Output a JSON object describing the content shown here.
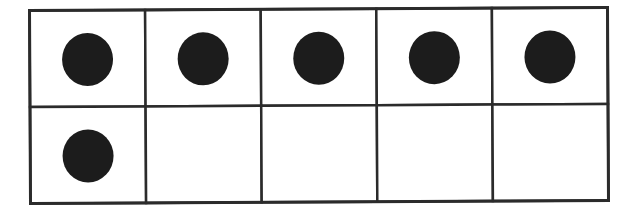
{
  "diagram": {
    "type": "ten-frame",
    "rows": 2,
    "columns": 5,
    "filled_count": 6,
    "colors": {
      "line": "#2b2b2b",
      "dot": "#1c1c1c",
      "background": "#ffffff"
    },
    "cells": [
      {
        "row": 1,
        "col": 1,
        "filled": true
      },
      {
        "row": 1,
        "col": 2,
        "filled": true
      },
      {
        "row": 1,
        "col": 3,
        "filled": true
      },
      {
        "row": 1,
        "col": 4,
        "filled": true
      },
      {
        "row": 1,
        "col": 5,
        "filled": true
      },
      {
        "row": 2,
        "col": 1,
        "filled": true
      },
      {
        "row": 2,
        "col": 2,
        "filled": false
      },
      {
        "row": 2,
        "col": 3,
        "filled": false
      },
      {
        "row": 2,
        "col": 4,
        "filled": false
      },
      {
        "row": 2,
        "col": 5,
        "filled": false
      }
    ]
  }
}
